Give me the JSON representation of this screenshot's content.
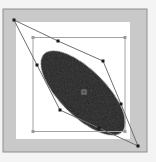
{
  "editor": {
    "tool": "free-transform",
    "shape": "ellipse",
    "colors": {
      "frame": "#c8c8c8",
      "frame_border": "#8c8c8c",
      "artboard": "#ffffff",
      "shape_fill": "#111111",
      "bounding_box": "#a0a0a0",
      "transform_outline": "#707070",
      "handle": "#222222"
    }
  }
}
